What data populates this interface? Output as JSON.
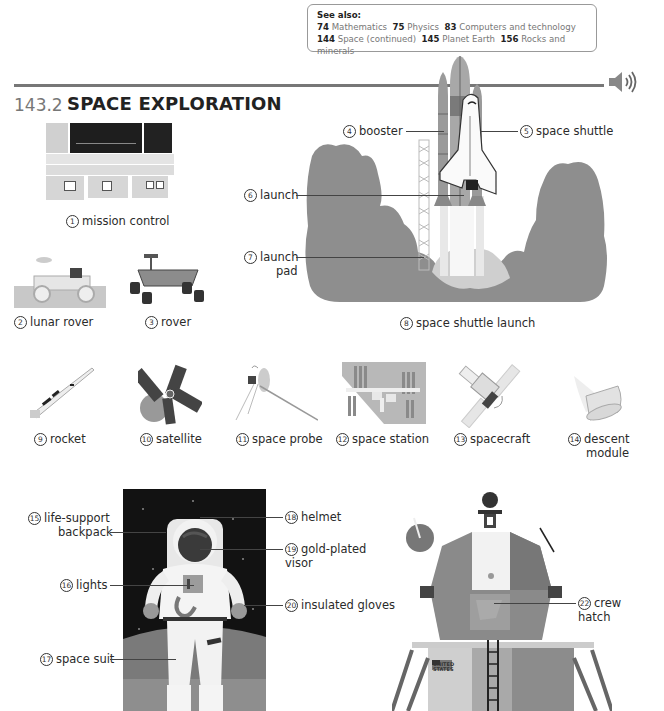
{
  "see_also": {
    "heading": "See also:",
    "links": [
      {
        "num": "74",
        "text": "Mathematics"
      },
      {
        "num": "75",
        "text": "Physics"
      },
      {
        "num": "83",
        "text": "Computers and technology"
      },
      {
        "num": "144",
        "text": "Space (continued)"
      },
      {
        "num": "145",
        "text": "Planet Earth"
      },
      {
        "num": "156",
        "text": "Rocks and minerals"
      }
    ]
  },
  "section": {
    "number": "143.2",
    "title": "SPACE EXPLORATION",
    "audio_icon": "speaker-icon"
  },
  "items": [
    {
      "n": "1",
      "label": "mission control"
    },
    {
      "n": "2",
      "label": "lunar rover"
    },
    {
      "n": "3",
      "label": "rover"
    },
    {
      "n": "4",
      "label": "booster"
    },
    {
      "n": "5",
      "label": "space shuttle"
    },
    {
      "n": "6",
      "label": "launch"
    },
    {
      "n": "7",
      "label_line1": "launch",
      "label_line2": "pad"
    },
    {
      "n": "8",
      "label": "space shuttle launch"
    },
    {
      "n": "9",
      "label": "rocket"
    },
    {
      "n": "10",
      "label": "satellite"
    },
    {
      "n": "11",
      "label": "space probe"
    },
    {
      "n": "12",
      "label": "space station"
    },
    {
      "n": "13",
      "label": "spacecraft"
    },
    {
      "n": "14",
      "label_line1": "descent",
      "label_line2": "module"
    },
    {
      "n": "15",
      "label_line1": "life-support",
      "label_line2": "backpack"
    },
    {
      "n": "16",
      "label": "lights"
    },
    {
      "n": "17",
      "label": "space suit"
    },
    {
      "n": "18",
      "label": "helmet"
    },
    {
      "n": "19",
      "label_line1": "gold-plated",
      "label_line2": "visor"
    },
    {
      "n": "20",
      "label": "insulated gloves"
    },
    {
      "n": "22",
      "label_line1": "crew",
      "label_line2": "hatch"
    }
  ],
  "lunar_module_flag_text": "UNITED STATES"
}
